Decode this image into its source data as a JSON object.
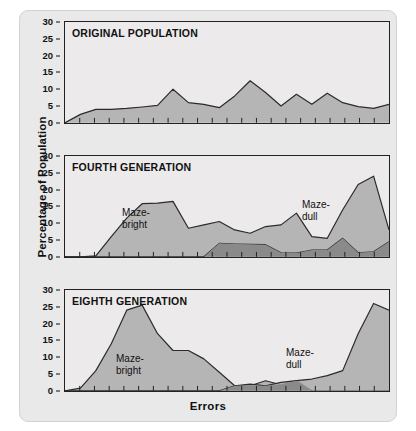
{
  "axes": {
    "ylabel": "Percentage of Population",
    "xlabel": "Errors",
    "yticks": [
      "30",
      "25",
      "20",
      "15",
      "10",
      "5",
      "0"
    ]
  },
  "colors": {
    "fill": "#a9a9a9",
    "fill_overlap": "#8a8a8a",
    "stroke": "#2b2b2b",
    "panel_bg": "#eceaea",
    "figure_bg": "#e9e9e9"
  },
  "panels": [
    {
      "title": "ORIGINAL POPULATION",
      "annotations": []
    },
    {
      "title": "FOURTH GENERATION",
      "annotations": [
        {
          "line1": "Maze-",
          "line2": "bright",
          "x": 58,
          "y": 52
        },
        {
          "line1": "Maze-",
          "line2": "dull",
          "x": 238,
          "y": 44
        }
      ]
    },
    {
      "title": "EIGHTH GENERATION",
      "annotations": [
        {
          "line1": "Maze-",
          "line2": "bright",
          "x": 52,
          "y": 64
        },
        {
          "line1": "Maze-",
          "line2": "dull",
          "x": 222,
          "y": 58
        }
      ]
    }
  ],
  "chart_data": {
    "type": "area",
    "xlabel": "Errors",
    "ylabel": "Percentage of Population",
    "ylim": [
      0,
      30
    ],
    "yticks": [
      0,
      5,
      10,
      15,
      20,
      25,
      30
    ],
    "grid": false,
    "legend": "in-plot annotations",
    "n_xticks": 22,
    "x": [
      0,
      1,
      2,
      3,
      4,
      5,
      6,
      7,
      8,
      9,
      10,
      11,
      12,
      13,
      14,
      15,
      16,
      17,
      18,
      19,
      20,
      21
    ],
    "panels": [
      {
        "name": "ORIGINAL POPULATION",
        "series": [
          {
            "name": "Original population",
            "values": [
              0,
              2.5,
              4,
              4,
              4.3,
              4.7,
              5.2,
              10,
              6,
              5.5,
              4.5,
              8,
              12.5,
              9,
              5,
              8.5,
              5.5,
              8.8,
              6,
              4.8,
              4.3,
              5.5
            ]
          }
        ]
      },
      {
        "name": "FOURTH GENERATION",
        "series": [
          {
            "name": "Maze-bright",
            "values": [
              0,
              0,
              0,
              0,
              0,
              0,
              0,
              0,
              0,
              0,
              4,
              3.8,
              3.7,
              3.6,
              1.2,
              1.1,
              2,
              2,
              5.5,
              1.2,
              1.5,
              4.5
            ]
          },
          {
            "name": "Maze-dull",
            "values": [
              0,
              0,
              0.3,
              6,
              11.5,
              15.8,
              16,
              16.5,
              8.5,
              9.5,
              10.5,
              8,
              7,
              9,
              9.5,
              13,
              6,
              5.5,
              14,
              21.5,
              24,
              8
            ]
          }
        ]
      },
      {
        "name": "EIGHTH GENERATION",
        "series": [
          {
            "name": "Maze-bright",
            "values": [
              0,
              0.8,
              6,
              14,
              24,
              25.5,
              17,
              12,
              12,
              9.5,
              5.5,
              1.5,
              1.5,
              3,
              1.8,
              3,
              0,
              0,
              0,
              0,
              0,
              0
            ]
          },
          {
            "name": "Maze-dull",
            "values": [
              0,
              0,
              0,
              0,
              0,
              0,
              0,
              0,
              0,
              0,
              0,
              1.5,
              2,
              1.5,
              2.5,
              3,
              3.5,
              4.5,
              6,
              17,
              26,
              24
            ]
          }
        ]
      }
    ]
  }
}
